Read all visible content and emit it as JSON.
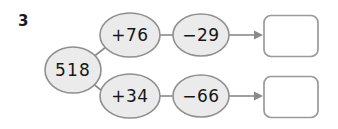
{
  "question": {
    "number": "3",
    "start_value": "518"
  },
  "branches": [
    {
      "id": "upper",
      "operations": [
        {
          "label": "+76"
        },
        {
          "label": "−29"
        }
      ],
      "answer": {
        "value": "",
        "placeholder": ""
      }
    },
    {
      "id": "lower",
      "operations": [
        {
          "label": "+34"
        },
        {
          "label": "−66"
        }
      ],
      "answer": {
        "value": "",
        "placeholder": ""
      }
    }
  ],
  "colors": {
    "background": "#ffffff",
    "oval_fill": "#ebebeb",
    "oval_stroke": "#8f8f8f",
    "line": "#8a8a8a",
    "box_stroke": "#9a9a9a",
    "text": "#161616"
  },
  "icons": {
    "arrow": "arrow-right-icon"
  }
}
